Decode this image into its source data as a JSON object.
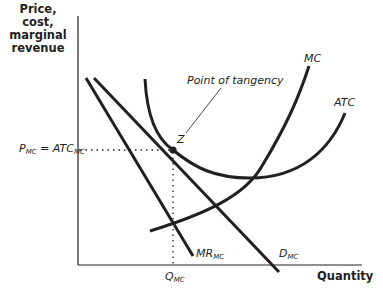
{
  "axes": {
    "y_label_lines": [
      "Price,",
      "cost,",
      "marginal",
      "revenue"
    ],
    "x_label": "Quantity"
  },
  "annotations": {
    "tangency_label": "Point of tangency",
    "point_label": "Z",
    "price_label_main": "P",
    "price_label_sub": "MC",
    "price_label_eq": " = ATC",
    "price_label_eq_sub": "MC",
    "quantity_label_main": "Q",
    "quantity_label_sub": "MC"
  },
  "curves": {
    "mc": {
      "label": "MC"
    },
    "atc": {
      "label": "ATC"
    },
    "demand": {
      "label_main": "D",
      "label_sub": "MC"
    },
    "mr": {
      "label_main": "MR",
      "label_sub": "MC"
    }
  },
  "colors": {
    "ink": "#231f20",
    "background": "#ffffff"
  }
}
